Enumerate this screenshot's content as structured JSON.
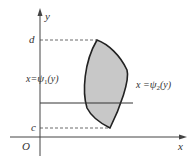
{
  "diagram": {
    "axes": {
      "x_label": "x",
      "y_label": "y",
      "origin_label": "O"
    },
    "bounds": {
      "top_label": "d",
      "bottom_label": "c"
    },
    "curves": {
      "left": {
        "label_prefix": "x=",
        "func": "ψ",
        "sub": "1",
        "arg": "(y)"
      },
      "right": {
        "label_prefix": "x =",
        "func": "ψ",
        "sub": "2",
        "arg": "(y)"
      }
    },
    "colors": {
      "region_fill": "#c8c8c8",
      "stroke": "#222222"
    }
  }
}
